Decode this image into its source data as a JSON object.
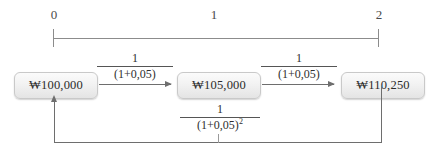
{
  "figure": {
    "type": "time-value-diagram",
    "currency_symbol": "₩",
    "interest_rate": "0,05",
    "timeline": {
      "labels": [
        "0",
        "1",
        "2"
      ],
      "ticks": [
        "0",
        "2"
      ]
    },
    "nodes": [
      {
        "period": "0",
        "label": "₩100,000"
      },
      {
        "period": "1",
        "label": "₩105,000"
      },
      {
        "period": "2",
        "label": "₩110,250"
      }
    ],
    "edges": [
      {
        "name": "discount-0-to-1",
        "direction": "right",
        "numerator": "1",
        "denominator": "(1+0,05)"
      },
      {
        "name": "discount-1-to-2",
        "direction": "right",
        "numerator": "1",
        "denominator": "(1+0,05)"
      },
      {
        "name": "discount-2-to-0",
        "direction": "left",
        "numerator": "1",
        "denominator_base": "(1+0,05)",
        "denominator_exponent": "2"
      }
    ]
  },
  "colors": {
    "axis": "#8c8c8c",
    "arrow": "#6e6e6e",
    "box_border": "#c9c9c9",
    "text": "#2b2b2b",
    "background": "#ffffff"
  }
}
